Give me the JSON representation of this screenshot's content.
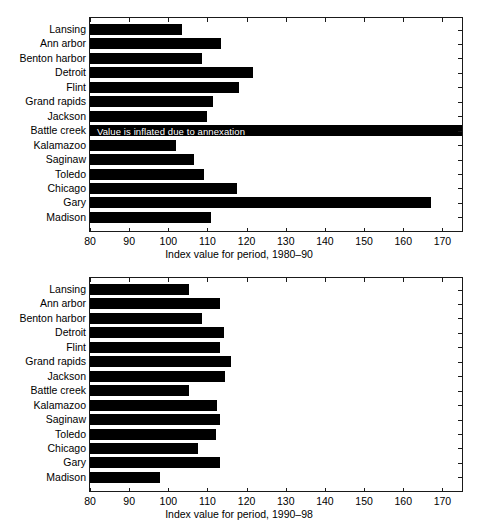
{
  "figure": {
    "background_color": "#ffffff",
    "bar_color": "#000000",
    "axis_color": "#1a1a1a",
    "annotation_text_color": "#ffffff"
  },
  "chart_data": [
    {
      "type": "bar",
      "orientation": "horizontal",
      "panel": "top",
      "title": "",
      "xlabel": "Index value for period, 1980–90",
      "ylabel": "",
      "xlim": [
        80,
        175
      ],
      "xticks": [
        80,
        90,
        100,
        110,
        120,
        130,
        140,
        150,
        160,
        170
      ],
      "xticklabels": [
        "80",
        "90",
        "100",
        "110",
        "120",
        "130",
        "140",
        "150",
        "160",
        "170"
      ],
      "grid": false,
      "legend": false,
      "categories": [
        "Lansing",
        "Ann arbor",
        "Benton harbor",
        "Detroit",
        "Flint",
        "Grand rapids",
        "Jackson",
        "Battle creek",
        "Kalamazoo",
        "Saginaw",
        "Toledo",
        "Chicago",
        "Gary",
        "Madison"
      ],
      "values": [
        103.5,
        113.5,
        108.5,
        121.5,
        118,
        111.5,
        110,
        175,
        102,
        106.5,
        109,
        117.5,
        167,
        111
      ],
      "annotations": [
        {
          "category": "Battle creek",
          "text": "Value is inflated due to annexation"
        }
      ]
    },
    {
      "type": "bar",
      "orientation": "horizontal",
      "panel": "bottom",
      "title": "",
      "xlabel": "Index value for period, 1990–98",
      "ylabel": "",
      "xlim": [
        80,
        175
      ],
      "xticks": [
        80,
        90,
        100,
        110,
        120,
        130,
        140,
        150,
        160,
        170
      ],
      "xticklabels": [
        "80",
        "90",
        "100",
        "110",
        "120",
        "130",
        "140",
        "150",
        "160",
        "170"
      ],
      "grid": false,
      "legend": false,
      "categories": [
        "Lansing",
        "Ann arbor",
        "Benton harbor",
        "Detroit",
        "Flint",
        "Grand rapids",
        "Jackson",
        "Battle creek",
        "Kalamazoo",
        "Saginaw",
        "Toledo",
        "Chicago",
        "Gary",
        "Madison"
      ],
      "values": [
        105.2,
        113.2,
        108.5,
        114.2,
        113.3,
        116,
        114.6,
        105.3,
        112.5,
        113.3,
        112.3,
        107.5,
        113.3,
        98
      ],
      "annotations": []
    }
  ]
}
